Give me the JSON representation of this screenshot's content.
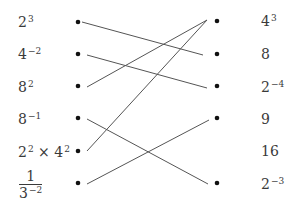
{
  "left_items": [
    {
      "base": "2",
      "exp": "3"
    },
    {
      "base": "4",
      "exp": "−2"
    },
    {
      "base": "8",
      "exp": "2"
    },
    {
      "base": "8",
      "exp": "−1"
    },
    {
      "base": "2",
      "exp": "2",
      "times": " × ",
      "base2": "4",
      "exp2": "2"
    },
    {
      "numerator": "1",
      "den_base": "3",
      "den_exp": "−2"
    }
  ],
  "right_items": [
    {
      "base": "4",
      "exp": "3"
    },
    {
      "base": "8",
      "exp": ""
    },
    {
      "base": "2",
      "exp": "−4"
    },
    {
      "base": "9",
      "exp": ""
    },
    {
      "base": "16",
      "exp": ""
    },
    {
      "base": "2",
      "exp": "−3"
    }
  ],
  "connections": [
    {
      "from": "2^3",
      "to": "8"
    },
    {
      "from": "4^-2",
      "to": "2^-4"
    },
    {
      "from": "8^2",
      "to": "4^3"
    },
    {
      "from": "8^-1",
      "to": "2^-3"
    },
    {
      "from": "2^2 x 4^2",
      "to": "4^3"
    },
    {
      "from": "1/3^-2",
      "to": "9"
    }
  ],
  "colors": {
    "text": "#3a3a3a",
    "line": "#555555",
    "dot": "#111111"
  }
}
